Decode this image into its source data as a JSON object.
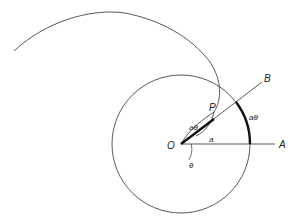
{
  "diagram": {
    "type": "geometry",
    "labels": {
      "origin": "O",
      "point_a": "A",
      "point_b": "B",
      "point_p": "P",
      "radius": "a",
      "angle": "θ",
      "segment_op": "aθ",
      "arc_length": "aθ"
    },
    "colors": {
      "line": "#333333",
      "thick": "#111111",
      "background": "#ffffff"
    }
  }
}
